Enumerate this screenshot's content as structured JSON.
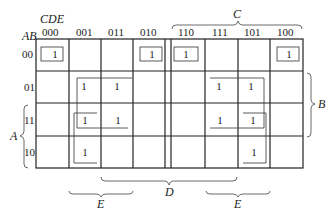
{
  "kmap": {
    "row_var_label": "AB",
    "col_var_label": "CDE",
    "col_headers": [
      "000",
      "001",
      "011",
      "010",
      "110",
      "111",
      "101",
      "100"
    ],
    "row_headers": [
      "00",
      "01",
      "11",
      "10"
    ],
    "cells": [
      [
        "1",
        "",
        "",
        "1",
        "1",
        "",
        "",
        "1"
      ],
      [
        "",
        "1",
        "1",
        "",
        "",
        "1",
        "1",
        ""
      ],
      [
        "",
        "1",
        "1",
        "",
        "",
        "1",
        "1",
        ""
      ],
      [
        "",
        "1",
        "",
        "",
        "",
        "",
        "1",
        ""
      ]
    ],
    "brace_labels": {
      "C": "C",
      "B": "B",
      "A": "A",
      "D": "D",
      "E_left": "E",
      "E_right": "E"
    }
  }
}
